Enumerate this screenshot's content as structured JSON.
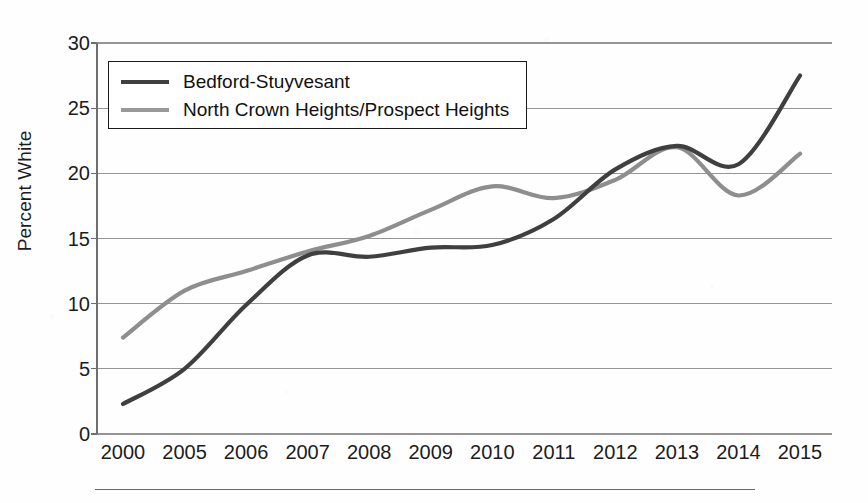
{
  "chart_data": {
    "type": "line",
    "title": "",
    "xlabel": "",
    "ylabel": "Percent White",
    "ylim": [
      0,
      30
    ],
    "yticks": [
      0,
      5,
      10,
      15,
      20,
      25,
      30
    ],
    "ytick_labels": [
      "0",
      "5",
      "10",
      "15",
      "20",
      "25",
      "30"
    ],
    "categories": [
      "2000",
      "2005",
      "2006",
      "2007",
      "2008",
      "2009",
      "2010",
      "2011",
      "2012",
      "2013",
      "2014",
      "2015"
    ],
    "grid": "horizontal",
    "legend_position": "upper-left-inside",
    "smoothing": "spline",
    "series": [
      {
        "name": "Bedford-Stuyvesant",
        "color": "#3f3f3f",
        "values": [
          2.3,
          5.0,
          9.9,
          13.7,
          13.6,
          14.3,
          14.5,
          16.5,
          20.3,
          22.1,
          20.7,
          27.5
        ]
      },
      {
        "name": "North Crown Heights/Prospect Heights",
        "color": "#8e8e8e",
        "values": [
          7.4,
          11.0,
          12.5,
          14.0,
          15.2,
          17.2,
          19.0,
          18.1,
          19.5,
          22.0,
          18.3,
          21.5
        ]
      }
    ]
  },
  "legend": {
    "entries": [
      {
        "label": "Bedford-Stuyvesant",
        "color": "#3f3f3f",
        "thickness": 4
      },
      {
        "label": "North Crown Heights/Prospect Heights",
        "color": "#9a9a9a",
        "thickness": 4
      }
    ]
  },
  "axes": {
    "y_title": "Percent White",
    "axis_color": "#6e6e6e",
    "grid_color": "#8d8d8d"
  }
}
